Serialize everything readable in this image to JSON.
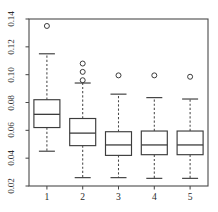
{
  "chart_data": {
    "type": "box",
    "title": "",
    "xlabel": "",
    "ylabel": "",
    "categories": [
      "1",
      "2",
      "3",
      "4",
      "5"
    ],
    "xtick_labels": [
      "1",
      "2",
      "3",
      "4",
      "5"
    ],
    "ytick_labels": [
      "0.02",
      "0.04",
      "0.06",
      "0.08",
      "0.10",
      "0.12",
      "0.14"
    ],
    "ytick_values": [
      0.02,
      0.04,
      0.06,
      0.08,
      0.1,
      0.12,
      0.14
    ],
    "ylim": [
      0.02,
      0.14
    ],
    "xlim": [
      0.5,
      5.5
    ],
    "grid": false,
    "legend": null,
    "orientation": "vertical",
    "colors": {
      "line": "#3c3c3c",
      "frame": "#4a4a4a",
      "box_fill": "#ffffff",
      "background": "#ffffff",
      "outlier": "#3c3c3c"
    },
    "boxes": [
      {
        "category": "1",
        "whisker_low": 0.045,
        "q1": 0.062,
        "median": 0.0715,
        "q3": 0.082,
        "whisker_high": 0.115,
        "outliers": [
          0.135
        ]
      },
      {
        "category": "2",
        "whisker_low": 0.026,
        "q1": 0.049,
        "median": 0.058,
        "q3": 0.0685,
        "whisker_high": 0.094,
        "outliers": [
          0.096,
          0.102,
          0.108
        ]
      },
      {
        "category": "3",
        "whisker_low": 0.026,
        "q1": 0.042,
        "median": 0.0495,
        "q3": 0.059,
        "whisker_high": 0.086,
        "outliers": [
          0.0995
        ]
      },
      {
        "category": "4",
        "whisker_low": 0.0255,
        "q1": 0.0425,
        "median": 0.0495,
        "q3": 0.0595,
        "whisker_high": 0.0835,
        "outliers": [
          0.0995
        ]
      },
      {
        "category": "5",
        "whisker_low": 0.0255,
        "q1": 0.0425,
        "median": 0.0495,
        "q3": 0.0595,
        "whisker_high": 0.0825,
        "outliers": [
          0.0985
        ]
      }
    ]
  },
  "figure": {
    "plot_area": {
      "left": 29,
      "right": 208,
      "top": 19,
      "bottom": 186
    },
    "box_width": 26,
    "cap_width": 16,
    "outlier_radius": 2.5
  }
}
